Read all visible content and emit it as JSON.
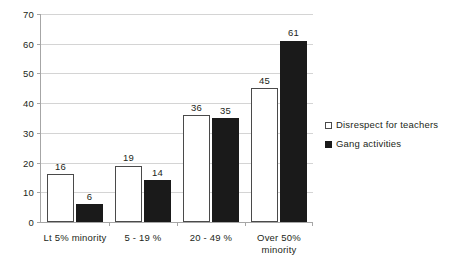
{
  "chart_data": {
    "type": "bar",
    "title": "",
    "xlabel": "",
    "ylabel": "",
    "ylim": [
      0,
      70
    ],
    "ytick_step": 10,
    "yticks": [
      "0",
      "10",
      "20",
      "30",
      "40",
      "50",
      "60",
      "70"
    ],
    "grid": true,
    "legend_position": "right",
    "categories": [
      "Lt 5% minority",
      "5 - 19 %",
      "20 - 49 %",
      "Over 50% minority"
    ],
    "category_lines": [
      [
        "Lt 5% minority"
      ],
      [
        "5 - 19 %"
      ],
      [
        "20 - 49 %"
      ],
      [
        "Over 50%",
        "minority"
      ]
    ],
    "series": [
      {
        "name": "Disrespect for teachers",
        "values": [
          16,
          19,
          36,
          45
        ],
        "color": "#ffffff",
        "edge_color": "#4a4a4a"
      },
      {
        "name": "Gang activities",
        "values": [
          6,
          14,
          35,
          61
        ],
        "color": "#1a1a1a",
        "edge_color": "#1a1a1a"
      }
    ],
    "data_labels": [
      [
        "16",
        "6"
      ],
      [
        "19",
        "14"
      ],
      [
        "36",
        "35"
      ],
      [
        "45",
        "61"
      ]
    ]
  },
  "legend": {
    "items": [
      {
        "label": "Disrespect for teachers",
        "swatch": "open-square-marker"
      },
      {
        "label": "Gang activities",
        "swatch": "filled-square-marker"
      }
    ]
  },
  "colors": {
    "gridline": "#d4d4d4",
    "axis": "#a6a6a6",
    "text": "#231f20",
    "series_light": "#ffffff",
    "series_dark": "#1a1a1a",
    "background": "#ffffff"
  }
}
